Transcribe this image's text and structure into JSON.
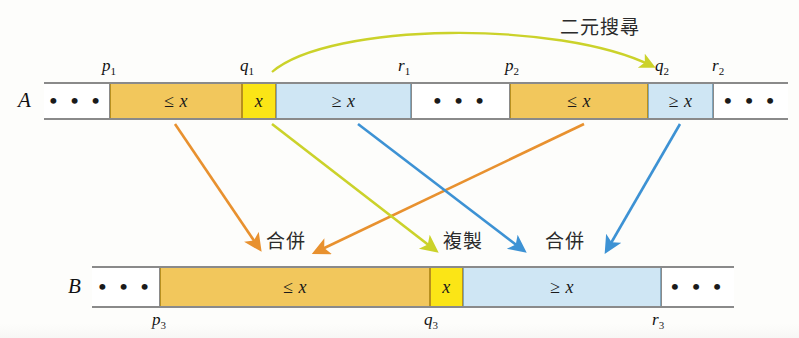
{
  "figure": {
    "title_note": "二元搜尋",
    "arrays": [
      {
        "name": "A",
        "cells": [
          {
            "id": "a-ellipsis-left",
            "label": "• • •",
            "fill": "white"
          },
          {
            "id": "a-le-x-1",
            "label": "≤ x",
            "fill": "orange"
          },
          {
            "id": "a-x-1",
            "label": "x",
            "fill": "yellow"
          },
          {
            "id": "a-ge-x-1",
            "label": "≥ x",
            "fill": "blue"
          },
          {
            "id": "a-ellipsis-mid",
            "label": "• • •",
            "fill": "white"
          },
          {
            "id": "a-le-x-2",
            "label": "≤ x",
            "fill": "orange"
          },
          {
            "id": "a-ge-x-2",
            "label": "≥ x",
            "fill": "blue"
          },
          {
            "id": "a-ellipsis-right",
            "label": "• • •",
            "fill": "white"
          }
        ],
        "indices": [
          {
            "id": "p1",
            "label": "p",
            "sub": "1"
          },
          {
            "id": "q1",
            "label": "q",
            "sub": "1"
          },
          {
            "id": "r1",
            "label": "r",
            "sub": "1"
          },
          {
            "id": "p2",
            "label": "p",
            "sub": "2"
          },
          {
            "id": "q2",
            "label": "q",
            "sub": "2"
          },
          {
            "id": "r2",
            "label": "r",
            "sub": "2"
          }
        ]
      },
      {
        "name": "B",
        "cells": [
          {
            "id": "b-ellipsis-left",
            "label": "• • •",
            "fill": "white"
          },
          {
            "id": "b-le-x",
            "label": "≤ x",
            "fill": "orange"
          },
          {
            "id": "b-x",
            "label": "x",
            "fill": "yellow"
          },
          {
            "id": "b-ge-x",
            "label": "≥ x",
            "fill": "blue"
          },
          {
            "id": "b-ellipsis-right",
            "label": "• • •",
            "fill": "white"
          }
        ],
        "indices": [
          {
            "id": "p3",
            "label": "p",
            "sub": "3"
          },
          {
            "id": "q3",
            "label": "q",
            "sub": "3"
          },
          {
            "id": "r3",
            "label": "r",
            "sub": "3"
          }
        ]
      }
    ],
    "operations": [
      {
        "id": "merge-left",
        "label": "合併"
      },
      {
        "id": "copy",
        "label": "複製"
      },
      {
        "id": "merge-right",
        "label": "合併"
      }
    ],
    "colors": {
      "orange_fill": "#f2c75c",
      "yellow_fill": "#fbe516",
      "blue_fill": "#cfe6f4",
      "orange_arrow": "#e8912f",
      "yellow_arrow": "#cbd22a",
      "blue_arrow": "#3d92d4",
      "border_gray": "#8a8a8a"
    }
  }
}
